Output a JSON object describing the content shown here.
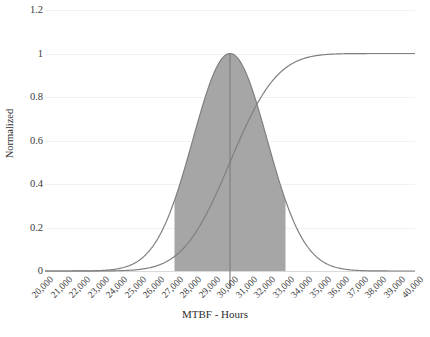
{
  "chart_data": {
    "type": "line",
    "title": "",
    "xlabel": "MTBF - Hours",
    "ylabel": "Normalized",
    "xlim": [
      20000,
      40000
    ],
    "ylim": [
      0,
      1.2
    ],
    "grid": true,
    "legend": false,
    "x_tick_labels": [
      "20,000",
      "21,000",
      "22,000",
      "23,000",
      "24,000",
      "25,000",
      "26,000",
      "27,000",
      "28,000",
      "29,000",
      "30,000",
      "31,000",
      "32,000",
      "33,000",
      "34,000",
      "35,000",
      "36,000",
      "37,000",
      "38,000",
      "39,000",
      "40,000"
    ],
    "y_tick_labels": [
      "0",
      "0.2",
      "0.4",
      "0.6",
      "0.8",
      "1",
      "1.2"
    ],
    "y_tick_values": [
      0,
      0.2,
      0.4,
      0.6,
      0.8,
      1,
      1.2
    ],
    "x": [
      20000,
      20500,
      21000,
      21500,
      22000,
      22500,
      23000,
      23500,
      24000,
      24500,
      25000,
      25500,
      26000,
      26500,
      27000,
      27500,
      28000,
      28500,
      29000,
      29500,
      30000,
      30500,
      31000,
      31500,
      32000,
      32500,
      33000,
      33500,
      34000,
      34500,
      35000,
      35500,
      36000,
      36500,
      37000,
      37500,
      38000,
      38500,
      39000,
      39500,
      40000
    ],
    "series": [
      {
        "name": "Normalized PDF",
        "type": "line",
        "color": "#808080",
        "filled_region": {
          "x_start": 27000,
          "x_end": 33000,
          "fill_color": "#a6a6a6"
        },
        "values": [
          0.0,
          0.0,
          0.0,
          0.0,
          0.0,
          0.0,
          0.0,
          0.001,
          0.001,
          0.004,
          0.011,
          0.029,
          0.066,
          0.135,
          0.247,
          0.405,
          0.607,
          0.811,
          0.969,
          1.0,
          1.0,
          0.969,
          0.882,
          0.811,
          0.607,
          0.405,
          0.247,
          0.135,
          0.066,
          0.029,
          0.011,
          0.004,
          0.001,
          0.001,
          0.0,
          0.0,
          0.0,
          0.0,
          0.0,
          0.0,
          0.0
        ]
      },
      {
        "name": "Normalized CDF",
        "type": "line",
        "color": "#808080",
        "values": [
          0.0,
          0.0,
          0.0,
          0.0,
          0.0,
          0.001,
          0.002,
          0.004,
          0.007,
          0.012,
          0.023,
          0.04,
          0.067,
          0.106,
          0.159,
          0.227,
          0.309,
          0.401,
          0.5,
          0.599,
          0.691,
          0.773,
          0.841,
          0.894,
          0.933,
          0.96,
          0.977,
          0.988,
          0.994,
          0.997,
          0.999,
          0.999,
          1.0,
          1.0,
          1.0,
          1.0,
          1.0,
          1.0,
          1.0,
          1.0,
          1.0
        ]
      }
    ],
    "annotations": [
      {
        "name": "mean-vertical-line",
        "type": "vline",
        "x": 30000,
        "y_top": 1.0,
        "y_bottom": 0.0,
        "color": "#808080"
      }
    ],
    "distribution": {
      "mean": 30000,
      "std_dev": 2000,
      "shaded_interval": [
        27000,
        33000
      ]
    }
  },
  "colors": {
    "curve": "#808080",
    "fill": "#a6a6a6",
    "gridline": "#f2f2f2",
    "baseline": "#d9d9d9",
    "text": "#3a3a3a"
  }
}
